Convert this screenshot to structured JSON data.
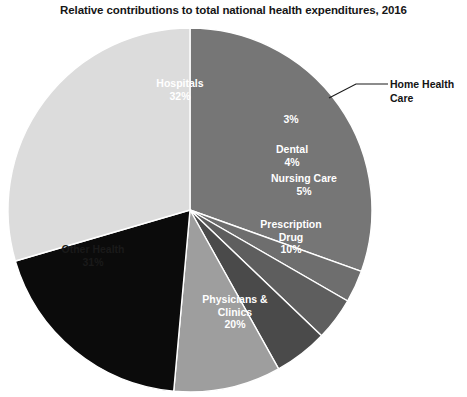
{
  "chart_data": {
    "type": "pie",
    "title": "Relative contributions to total national health expenditures, 2016",
    "xlabel": "",
    "ylabel": "",
    "legend_position": "none",
    "grid": false,
    "units": "percent",
    "start_angle_deg": 0,
    "direction": "clockwise",
    "center": {
      "x": 190,
      "y": 210
    },
    "radius": 182,
    "slices": [
      {
        "label": "Hospitals",
        "value": 32,
        "value_label": "32%",
        "color": "#767676",
        "text_color": "#ffffff",
        "label_placement": "inside"
      },
      {
        "label": "Home Health Care",
        "value": 3,
        "value_label": "3%",
        "color": "#6e6e6e",
        "text_color": "#ffffff",
        "label_placement": "callout"
      },
      {
        "label": "Dental",
        "value": 4,
        "value_label": "4%",
        "color": "#5e5e5e",
        "text_color": "#ffffff",
        "label_placement": "inside"
      },
      {
        "label": "Nursing Care",
        "value": 5,
        "value_label": "5%",
        "color": "#4a4a4a",
        "text_color": "#ffffff",
        "label_placement": "inside"
      },
      {
        "label": "Prescription Drug",
        "value": 10,
        "value_label": "10%",
        "color": "#9e9e9e",
        "text_color": "#ffffff",
        "label_placement": "inside"
      },
      {
        "label": "Physicians & Clinics",
        "value": 20,
        "value_label": "20%",
        "color": "#0b0b0b",
        "text_color": "#ffffff",
        "label_placement": "inside"
      },
      {
        "label": "Other Health",
        "value": 31,
        "value_label": "31%",
        "color": "#dcdcdc",
        "text_color": "#1a1a1a",
        "label_placement": "inside"
      }
    ],
    "annotations": [
      {
        "text": "Home Health Care",
        "line1": "Home Health",
        "line2": "Care",
        "points_to_slice": "Home Health Care",
        "leader_line": true
      }
    ]
  },
  "labels": {
    "hospitals_name": "Hospitals",
    "hospitals_value": "32%",
    "homehealth_value": "3%",
    "dental_name": "Dental",
    "dental_value": "4%",
    "nursing_name": "Nursing Care",
    "nursing_value": "5%",
    "prescription_name_line1": "Prescription",
    "prescription_name_line2": "Drug",
    "prescription_value": "10%",
    "physicians_name_line1": "Physicians &",
    "physicians_name_line2": "Clinics",
    "physicians_value": "20%",
    "otherhealth_name": "Other Health",
    "otherhealth_value": "31%",
    "callout_line1": "Home Health",
    "callout_line2": "Care"
  },
  "colors": {
    "background": "#ffffff",
    "title_text": "#161616",
    "leader_line": "#1a1a1a"
  }
}
